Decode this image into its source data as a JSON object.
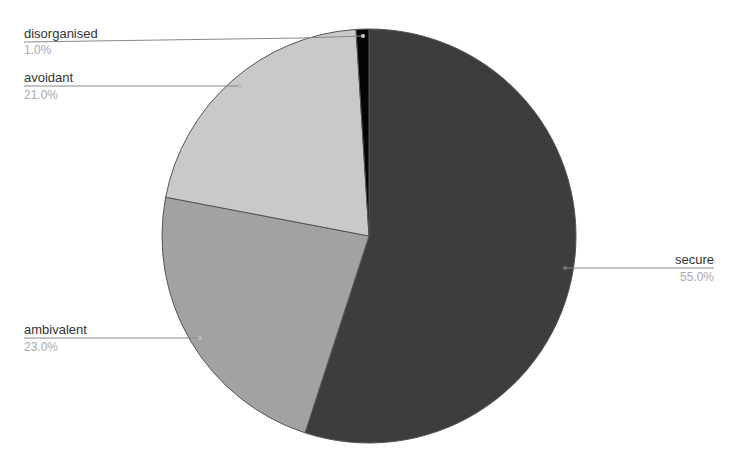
{
  "chart_data": {
    "type": "pie",
    "title": "",
    "categories": [
      "secure",
      "ambivalent",
      "avoidant",
      "disorganised"
    ],
    "values": [
      55.0,
      23.0,
      21.0,
      1.0
    ],
    "unit": "%",
    "labels": [
      "55.0%",
      "23.0%",
      "21.0%",
      "1.0%"
    ],
    "colors": [
      "#3d3d3d",
      "#a2a2a2",
      "#c9c9c9",
      "#050505"
    ],
    "start_angle_deg": 0,
    "direction": "clockwise",
    "legend": "none (leader-line labels)"
  },
  "labels": {
    "secure": {
      "name": "secure",
      "pct": "55.0%"
    },
    "ambivalent": {
      "name": "ambivalent",
      "pct": "23.0%"
    },
    "avoidant": {
      "name": "avoidant",
      "pct": "21.0%"
    },
    "disorganised": {
      "name": "disorganised",
      "pct": "1.0%"
    }
  }
}
